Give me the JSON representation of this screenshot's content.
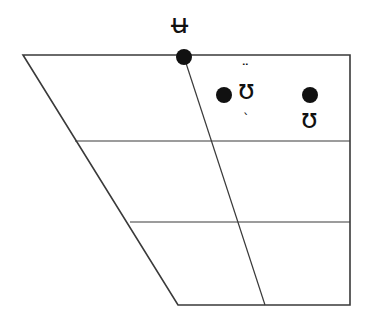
{
  "figure": {
    "kind": "ipa-vowel-quadrilateral",
    "width": 372,
    "height": 319,
    "background_color": "#ffffff",
    "line_color": "#3a3a3a",
    "dot_color": "#111111",
    "text_color": "#111111"
  },
  "chart_data": {
    "type": "scatter",
    "title": "",
    "subtitle": "",
    "xlabel": "",
    "ylabel": "",
    "legend": [],
    "grid": true,
    "axis_ranges_note": "IPA vowel quadrilateral; x = front–back (backness), y = close–open (height)",
    "quadrilateral_outline": [
      {
        "name": "top-left",
        "x": 23,
        "y": 55
      },
      {
        "name": "top-right",
        "x": 350,
        "y": 55
      },
      {
        "name": "bottom-right",
        "x": 350,
        "y": 305
      },
      {
        "name": "bottom-left",
        "x": 178,
        "y": 305
      }
    ],
    "height_gridlines": [
      {
        "name": "close-mid",
        "y": 141,
        "x_left": 75,
        "x_right": 350
      },
      {
        "name": "open-mid",
        "y": 222,
        "x_left": 130,
        "x_right": 350
      }
    ],
    "central_axis": {
      "name": "central-line",
      "x_top": 184,
      "y_top": 57,
      "x_bottom": 265,
      "y_bottom": 305
    },
    "points": [
      {
        "id": "u-bar",
        "symbol": "ʉ",
        "base": "ʉ",
        "diacritic_above": "",
        "diacritic_below": "",
        "description": "close central rounded vowel",
        "x": 184,
        "y": 57,
        "label_position": "above",
        "dot_radius": 8
      },
      {
        "id": "upsilon-centralized-less-rounded",
        "symbol": "ʊ̜̈",
        "base": "ʊ",
        "diacritic_above": "¨",
        "diacritic_below": "ˎ",
        "description": "near-close centralized less-rounded upsilon",
        "x": 224,
        "y": 95,
        "label_position": "right",
        "dot_radius": 8
      },
      {
        "id": "upsilon",
        "symbol": "ʊ",
        "base": "ʊ",
        "diacritic_above": "",
        "diacritic_below": "",
        "description": "near-close near-back rounded vowel",
        "x": 310,
        "y": 95,
        "label_position": "below",
        "dot_radius": 8
      }
    ]
  },
  "labels": {
    "u_bar": "ʉ",
    "upsilon_base": "ʊ",
    "diaeresis_above": "¨",
    "less_rounded_below": "ˎ",
    "upsilon_plain": "ʊ"
  }
}
